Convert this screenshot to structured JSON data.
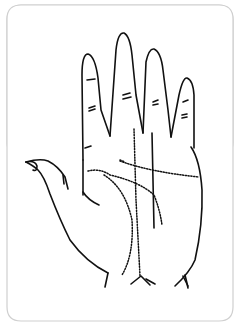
{
  "figure": {
    "colors": {
      "background": "#ffffff",
      "frame": "#cfcfcf",
      "ink": "#111111"
    },
    "lines": [
      {
        "name": "heart-line",
        "style": "dotted"
      },
      {
        "name": "head-line",
        "style": "dotted"
      },
      {
        "name": "life-line",
        "style": "dotted"
      },
      {
        "name": "fate-line",
        "style": "dotted"
      },
      {
        "name": "sun-line",
        "style": "solid"
      }
    ]
  }
}
